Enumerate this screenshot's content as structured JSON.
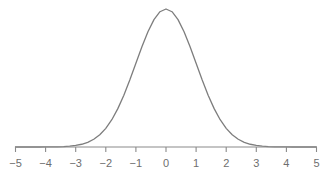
{
  "figure": {
    "title": "",
    "width": 332,
    "height": 178,
    "background_color": "#ffffff",
    "curve_color": "#7d7d7d",
    "axis_color": "#8a8a8a",
    "tick_color": "#8a8a8a",
    "label_color": "#6e6e6e"
  },
  "axis": {
    "baseline_y": 147,
    "x_start_px": 15,
    "x_end_px": 316,
    "pixels_per_unit": 30.1,
    "origin_px": 166,
    "tick_length_px": 5,
    "tick_direction": "down",
    "labels": [
      "−5",
      "−4",
      "−3",
      "−2",
      "−1",
      "0",
      "1",
      "2",
      "3",
      "4",
      "5"
    ],
    "tick_values": [
      -5,
      -4,
      -3,
      -2,
      -1,
      0,
      1,
      2,
      3,
      4,
      5
    ]
  },
  "chart_data": {
    "type": "line",
    "title": "",
    "subtitle": "",
    "xlabel": "",
    "ylabel": "",
    "xlim": [
      -5,
      5
    ],
    "ylim": [
      0,
      0.4
    ],
    "grid": false,
    "legend": null,
    "annotations": [],
    "xticks": [
      -5,
      -4,
      -3,
      -2,
      -1,
      0,
      1,
      2,
      3,
      4,
      5
    ],
    "xticklabels": [
      "−5",
      "−4",
      "−3",
      "−2",
      "−1",
      "0",
      "1",
      "2",
      "3",
      "4",
      "5"
    ],
    "yticks": [],
    "yticklabels": [],
    "distribution": {
      "name": "normal",
      "mean": 0,
      "sigma": 1,
      "peak_value": 0.3989
    },
    "series": [
      {
        "name": "standard normal pdf",
        "color": "#7d7d7d",
        "linewidth": 1.3,
        "x": [
          -5.0,
          -4.8,
          -4.6,
          -4.4,
          -4.2,
          -4.0,
          -3.8,
          -3.6,
          -3.4,
          -3.2,
          -3.0,
          -2.8,
          -2.6,
          -2.4,
          -2.2,
          -2.0,
          -1.8,
          -1.6,
          -1.4,
          -1.2,
          -1.0,
          -0.8,
          -0.6,
          -0.4,
          -0.2,
          0.0,
          0.2,
          0.4,
          0.6,
          0.8,
          1.0,
          1.2,
          1.4,
          1.6,
          1.8,
          2.0,
          2.2,
          2.4,
          2.6,
          2.8,
          3.0,
          3.2,
          3.4,
          3.6,
          3.8,
          4.0,
          4.2,
          4.4,
          4.6,
          4.8,
          5.0
        ],
        "y": [
          1.5e-06,
          4e-06,
          1.01e-05,
          2.49e-05,
          5.89e-05,
          0.0001338,
          0.0002919,
          0.0006119,
          0.0012322,
          0.0023841,
          0.0044318,
          0.0079155,
          0.013583,
          0.0223945,
          0.0354746,
          0.053991,
          0.0789502,
          0.1109208,
          0.1497275,
          0.1941861,
          0.2419707,
          0.2896916,
          0.3332246,
          0.3682701,
          0.3910427,
          0.3989423,
          0.3910427,
          0.3682701,
          0.3332246,
          0.2896916,
          0.2419707,
          0.1941861,
          0.1497275,
          0.1109208,
          0.0789502,
          0.053991,
          0.0354746,
          0.0223945,
          0.013583,
          0.0079155,
          0.0044318,
          0.0023841,
          0.0012322,
          0.0006119,
          0.0002919,
          0.0001338,
          5.89e-05,
          2.49e-05,
          1.01e-05,
          4e-06,
          1.5e-06
        ]
      }
    ]
  }
}
